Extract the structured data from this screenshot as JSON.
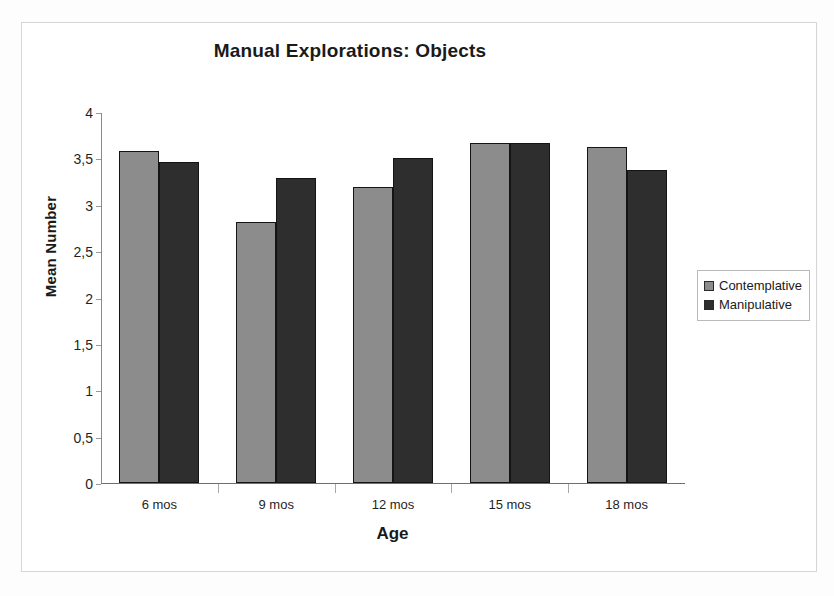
{
  "chart_data": {
    "type": "bar",
    "title": "Manual Explorations: Objects",
    "xlabel": "Age",
    "ylabel": "Mean Number",
    "categories": [
      "6 mos",
      "9 mos",
      "12 mos",
      "15 mos",
      "18 mos"
    ],
    "series": [
      {
        "name": "Contemplative",
        "color": "#8c8c8c",
        "values": [
          3.58,
          2.81,
          3.19,
          3.67,
          3.62
        ]
      },
      {
        "name": "Manipulative",
        "color": "#2e2e2e",
        "values": [
          3.46,
          3.29,
          3.5,
          3.67,
          3.37
        ]
      }
    ],
    "ylim": [
      0,
      4
    ],
    "ytick_values": [
      0,
      0.5,
      1,
      1.5,
      2,
      2.5,
      3,
      3.5,
      4
    ],
    "ytick_labels": [
      "0",
      "0,5",
      "1",
      "1,5",
      "2",
      "2,5",
      "3",
      "3,5",
      "4"
    ],
    "grid": false,
    "legend_position": "right"
  }
}
